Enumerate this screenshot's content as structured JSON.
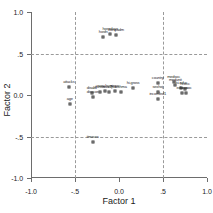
{
  "chart_data": {
    "type": "scatter",
    "title": "",
    "xlabel": "Factor 1",
    "ylabel": "Factor 2",
    "xlim": [
      -1.0,
      1.0
    ],
    "ylim": [
      -1.0,
      1.0
    ],
    "xticks": [
      -1.0,
      -0.5,
      0.0,
      0.5,
      1.0
    ],
    "yticks": [
      -1.0,
      -0.5,
      0.0,
      0.5,
      1.0
    ],
    "xticklabels": [
      "-1.0",
      "-.5",
      "0.0",
      ".5",
      "1.0"
    ],
    "yticklabels": [
      "-1.0",
      "-.5",
      "0.0",
      ".5",
      "1.0"
    ],
    "grid": true,
    "gridlines_x": [
      -0.5,
      0.5
    ],
    "gridlines_y": [
      -0.5,
      0.5
    ],
    "legend": "none",
    "marker": "open-square",
    "points": [
      {
        "label": "hosfri",
        "x": -0.18,
        "y": 0.7
      },
      {
        "label": "hospdays",
        "x": -0.1,
        "y": 0.74
      },
      {
        "label": "hospadm",
        "x": -0.03,
        "y": 0.72
      },
      {
        "label": "attacks",
        "x": -0.57,
        "y": 0.1
      },
      {
        "label": "age",
        "x": -0.56,
        "y": -0.11
      },
      {
        "label": "disabil",
        "x": -0.31,
        "y": 0.03
      },
      {
        "label": "disscore",
        "x": -0.29,
        "y": -0.02
      },
      {
        "label": "rhinitis",
        "x": -0.22,
        "y": 0.04
      },
      {
        "label": "nasalsym",
        "x": -0.16,
        "y": 0.05
      },
      {
        "label": "nasalpol",
        "x": -0.11,
        "y": 0.04
      },
      {
        "label": "sinus",
        "x": -0.05,
        "y": 0.05
      },
      {
        "label": "asthma",
        "x": 0.02,
        "y": 0.04
      },
      {
        "label": "hi-gross",
        "x": 0.16,
        "y": 0.08
      },
      {
        "label": "country",
        "x": 0.44,
        "y": 0.14
      },
      {
        "label": "sexhoj",
        "x": 0.44,
        "y": 0.04
      },
      {
        "label": "incomfed1",
        "x": 0.44,
        "y": -0.05
      },
      {
        "label": "medsoc",
        "x": 0.62,
        "y": 0.16
      },
      {
        "label": "medunit",
        "x": 0.64,
        "y": 0.12
      },
      {
        "label": "hi-educ",
        "x": 0.71,
        "y": 0.08
      },
      {
        "label": "hi-occ",
        "x": 0.75,
        "y": 0.07
      },
      {
        "label": "edusoc",
        "x": 0.72,
        "y": 0.02
      },
      {
        "label": "occsoc",
        "x": 0.76,
        "y": 0.02
      },
      {
        "label": "timeurs",
        "x": -0.3,
        "y": -0.57
      }
    ]
  }
}
